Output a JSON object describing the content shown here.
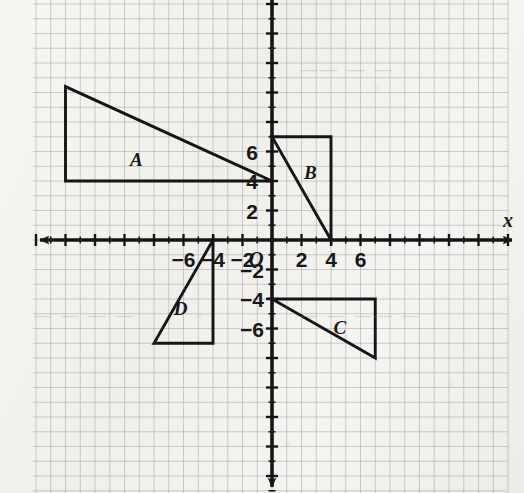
{
  "figure": {
    "kind": "coordinate-plane-with-triangles",
    "background_color": "#f4f3ef",
    "grid_color": "#a9afb8",
    "axis_color": "#141518",
    "shape_color": "#141518"
  },
  "axes": {
    "x_label": "x",
    "y_label": "",
    "origin_label": "O",
    "x_ticks": [
      {
        "value": -6,
        "label": "−6"
      },
      {
        "value": -4,
        "label": "−4"
      },
      {
        "value": -2,
        "label": "−2"
      },
      {
        "value": 2,
        "label": "2"
      },
      {
        "value": 4,
        "label": "4"
      },
      {
        "value": 6,
        "label": "6"
      }
    ],
    "y_ticks": [
      {
        "value": 6,
        "label": "6"
      },
      {
        "value": 4,
        "label": "4"
      },
      {
        "value": 2,
        "label": "2"
      },
      {
        "value": -2,
        "label": "−2"
      },
      {
        "value": -4,
        "label": "−4"
      },
      {
        "value": -6,
        "label": "−6"
      }
    ]
  },
  "chart_data": {
    "type": "scatter",
    "title": "",
    "xlabel": "x",
    "ylabel": "",
    "xlim": [
      -16.2,
      17.1
    ],
    "ylim": [
      -17.1,
      16.3
    ],
    "grid": true,
    "legend": "none",
    "unit_px": 14.75,
    "origin_px": {
      "x": 272,
      "y": 240
    },
    "shapes": [
      {
        "name": "A",
        "label": "A",
        "type": "right-triangle",
        "vertices": [
          [
            -14,
            4
          ],
          [
            -14,
            10.4
          ],
          [
            0,
            4
          ]
        ],
        "label_position": [
          -9.2,
          5.5
        ],
        "note": "apex extends above the top edge of the image"
      },
      {
        "name": "B",
        "label": "B",
        "type": "right-triangle",
        "vertices": [
          [
            0,
            7
          ],
          [
            4,
            7
          ],
          [
            4,
            0
          ]
        ],
        "label_position": [
          2.6,
          4.6
        ]
      },
      {
        "name": "C",
        "label": "C",
        "type": "right-triangle",
        "vertices": [
          [
            0,
            -4
          ],
          [
            7,
            -4
          ],
          [
            7,
            -8
          ]
        ],
        "label_position": [
          4.6,
          -5.9
        ]
      },
      {
        "name": "D",
        "label": "D",
        "type": "right-triangle",
        "vertices": [
          [
            -4,
            0
          ],
          [
            -4,
            -7
          ],
          [
            -8,
            -7
          ]
        ],
        "label_position": [
          -6.2,
          -4.6
        ]
      }
    ]
  },
  "ghost_marks": [
    {
      "text": "— — — —",
      "x": 34,
      "y": 306
    },
    {
      "text": "— — —— —",
      "x": 300,
      "y": 306
    },
    {
      "text": "—— — —",
      "x": 300,
      "y": 60
    }
  ]
}
